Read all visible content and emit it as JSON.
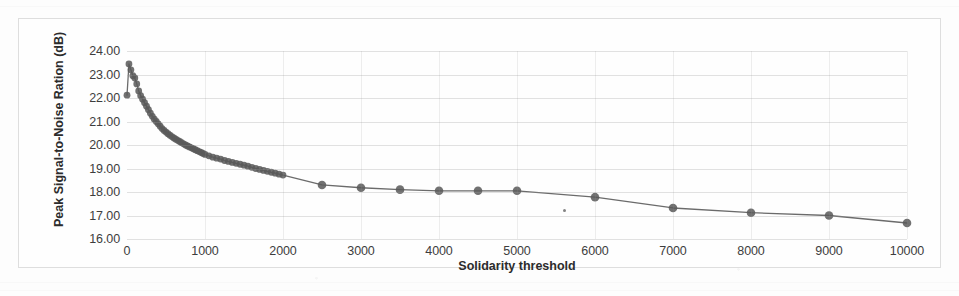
{
  "chart_data": {
    "type": "line",
    "title": "",
    "xlabel": "Solidarity threshold",
    "ylabel": "Peak Signal-to-Noise Ration (dB)",
    "xlim": [
      0,
      10000
    ],
    "ylim": [
      16.0,
      24.0
    ],
    "grid": true,
    "legend": "none",
    "marker": "filled-circle",
    "line_color": "#6b6b6b",
    "marker_color": "#5a5a5a",
    "y_ticks": [
      "16.00",
      "17.00",
      "18.00",
      "19.00",
      "20.00",
      "21.00",
      "22.00",
      "23.00",
      "24.00"
    ],
    "y_tick_values": [
      16,
      17,
      18,
      19,
      20,
      21,
      22,
      23,
      24
    ],
    "x_ticks": [
      "0",
      "1000",
      "2000",
      "3000",
      "4000",
      "5000",
      "6000",
      "7000",
      "8000",
      "9000",
      "10000"
    ],
    "x_tick_values": [
      0,
      1000,
      2000,
      3000,
      4000,
      5000,
      6000,
      7000,
      8000,
      9000,
      10000
    ],
    "series": [
      {
        "name": "PSNR vs Solidarity threshold",
        "x": [
          0,
          25,
          50,
          75,
          100,
          125,
          150,
          175,
          200,
          225,
          250,
          275,
          300,
          325,
          350,
          375,
          400,
          425,
          450,
          475,
          500,
          525,
          550,
          575,
          600,
          625,
          650,
          675,
          700,
          725,
          750,
          775,
          800,
          825,
          850,
          875,
          900,
          925,
          950,
          975,
          1000,
          1050,
          1100,
          1150,
          1200,
          1250,
          1300,
          1350,
          1400,
          1450,
          1500,
          1550,
          1600,
          1650,
          1700,
          1750,
          1800,
          1850,
          1900,
          1950,
          2000,
          2500,
          3000,
          3500,
          4000,
          4500,
          5000,
          6000,
          7000,
          8000,
          9000,
          10000
        ],
        "y": [
          22.12,
          23.45,
          23.2,
          22.95,
          22.85,
          22.6,
          22.3,
          22.1,
          21.95,
          21.8,
          21.65,
          21.5,
          21.35,
          21.22,
          21.1,
          21.0,
          20.9,
          20.8,
          20.7,
          20.62,
          20.55,
          20.48,
          20.42,
          20.36,
          20.3,
          20.25,
          20.2,
          20.15,
          20.1,
          20.05,
          20.0,
          19.96,
          19.92,
          19.88,
          19.84,
          19.8,
          19.76,
          19.72,
          19.68,
          19.64,
          19.6,
          19.54,
          19.48,
          19.44,
          19.4,
          19.34,
          19.3,
          19.26,
          19.22,
          19.18,
          19.14,
          19.1,
          19.05,
          19.0,
          18.96,
          18.92,
          18.88,
          18.84,
          18.8,
          18.76,
          18.72,
          18.3,
          18.18,
          18.1,
          18.05,
          18.05,
          18.05,
          17.78,
          17.32,
          17.12,
          17.0,
          16.68
        ]
      }
    ]
  }
}
